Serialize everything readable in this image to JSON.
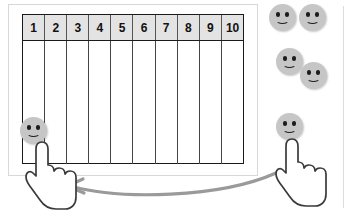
{
  "diagram": {
    "colors": {
      "face_fill": "#c6c6c6",
      "face_feature": "#1c1c1c",
      "grid_line": "#1a1a1a",
      "header_fill": "#e3e3e3",
      "outer_frame": "#d8d8d8",
      "arrow": "#9a9a9a",
      "hand_outline": "#3a3a3a",
      "hand_fill": "#ffffff"
    },
    "grid": {
      "columns": [
        {
          "label": "1"
        },
        {
          "label": "2"
        },
        {
          "label": "3"
        },
        {
          "label": "4"
        },
        {
          "label": "5"
        },
        {
          "label": "6"
        },
        {
          "label": "7"
        },
        {
          "label": "8"
        },
        {
          "label": "9"
        },
        {
          "label": "10"
        }
      ],
      "column_count": 10,
      "body_row_count": 1
    },
    "placed_tokens": [
      {
        "name": "smiley-token-in-column-1",
        "column": "1",
        "x": 34,
        "y": 131,
        "size": 27
      }
    ],
    "pool_tokens": [
      {
        "name": "smiley-token-pool-1",
        "x": 283,
        "y": 18,
        "size": 27
      },
      {
        "name": "smiley-token-pool-2",
        "x": 313,
        "y": 18,
        "size": 27
      },
      {
        "name": "smiley-token-pool-3",
        "x": 290,
        "y": 62,
        "size": 27
      },
      {
        "name": "smiley-token-pool-4",
        "x": 314,
        "y": 76,
        "size": 27
      },
      {
        "name": "smiley-token-pool-5",
        "x": 290,
        "y": 127,
        "size": 27
      }
    ],
    "cursors": [
      {
        "name": "hand-cursor-left",
        "x": 28,
        "y": 140
      },
      {
        "name": "hand-cursor-right",
        "x": 278,
        "y": 137
      }
    ],
    "arrow": {
      "name": "drag-direction-arrow",
      "direction": "right-to-left",
      "from_x": 272,
      "to_x": 68,
      "y": 186
    }
  }
}
